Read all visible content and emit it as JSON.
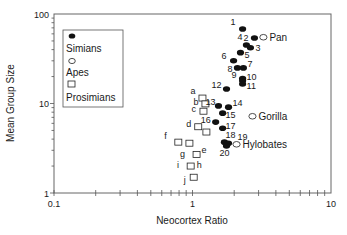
{
  "chart_data": {
    "type": "scatter",
    "title": "",
    "xlabel": "Neocortex Ratio",
    "ylabel": "Mean Group Size",
    "xscale": "log",
    "yscale": "log",
    "xlim": [
      0.1,
      10
    ],
    "ylim": [
      1,
      100
    ],
    "x_ticks": [
      "0.1",
      "1",
      "10"
    ],
    "y_ticks": [
      "1",
      "10",
      "100"
    ],
    "grid": false,
    "legend_position": "upper-left",
    "legend": [
      {
        "label": "Simians",
        "marker": "filled-circle"
      },
      {
        "label": "Apes",
        "marker": "open-circle"
      },
      {
        "label": "Prosimians",
        "marker": "open-square"
      }
    ],
    "series": [
      {
        "name": "Simians",
        "marker": "filled-circle",
        "points": [
          {
            "label": "1",
            "x": 2.3,
            "y": 68
          },
          {
            "label": "2",
            "x": 2.8,
            "y": 54
          },
          {
            "label": "3",
            "x": 2.62,
            "y": 42
          },
          {
            "label": "4",
            "x": 2.45,
            "y": 45
          },
          {
            "label": "5",
            "x": 2.22,
            "y": 37
          },
          {
            "label": "6",
            "x": 1.98,
            "y": 30
          },
          {
            "label": "7",
            "x": 2.33,
            "y": 25
          },
          {
            "label": "8",
            "x": 2.11,
            "y": 25
          },
          {
            "label": "9",
            "x": 2.3,
            "y": 19
          },
          {
            "label": "10",
            "x": 2.3,
            "y": 18
          },
          {
            "label": "11",
            "x": 2.3,
            "y": 16.5
          },
          {
            "label": "12",
            "x": 1.76,
            "y": 14.5
          },
          {
            "label": "13",
            "x": 1.54,
            "y": 9.4
          },
          {
            "label": "14",
            "x": 1.82,
            "y": 9.1
          },
          {
            "label": "15",
            "x": 1.65,
            "y": 7.8
          },
          {
            "label": "16",
            "x": 1.47,
            "y": 6.2
          },
          {
            "label": "17",
            "x": 1.65,
            "y": 5.3
          },
          {
            "label": "18",
            "x": 1.7,
            "y": 3.7
          },
          {
            "label": "19",
            "x": 1.82,
            "y": 3.6
          },
          {
            "label": "20",
            "x": 1.76,
            "y": 3.35
          }
        ]
      },
      {
        "name": "Apes",
        "marker": "open-circle",
        "points": [
          {
            "label": "Pan",
            "x": 3.25,
            "y": 55
          },
          {
            "label": "Gorilla",
            "x": 2.71,
            "y": 7.2
          },
          {
            "label": "Hylobates",
            "x": 2.08,
            "y": 3.5
          }
        ]
      },
      {
        "name": "Prosimians",
        "marker": "open-square",
        "points": [
          {
            "label": "a",
            "x": 1.18,
            "y": 11.5
          },
          {
            "label": "b",
            "x": 1.24,
            "y": 9.9
          },
          {
            "label": "c",
            "x": 1.2,
            "y": 8.2
          },
          {
            "label": "d",
            "x": 1.1,
            "y": 5.5
          },
          {
            "label": "",
            "x": 1.26,
            "y": 4.8
          },
          {
            "label": "f",
            "x": 0.79,
            "y": 3.7
          },
          {
            "label": "",
            "x": 0.95,
            "y": 3.6
          },
          {
            "label": "e",
            "x": 1.07,
            "y": 2.7
          },
          {
            "label": "h",
            "x": 0.97,
            "y": 2.0
          },
          {
            "label": "j",
            "x": 1.02,
            "y": 1.5
          }
        ]
      }
    ],
    "annotations": [
      {
        "text": "g",
        "px": [
          180,
          157
        ]
      },
      {
        "text": "i",
        "px": [
          177,
          168
        ]
      }
    ]
  }
}
